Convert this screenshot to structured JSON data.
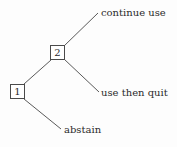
{
  "diagram": {
    "type": "game-tree",
    "background_color": "#fdfdfd",
    "line_color": "#5a5a5a",
    "text_color": "#2b2b2b",
    "node_border_color": "#4a4a4a",
    "node_fill_color": "#ffffff",
    "nodes": [
      {
        "id": "node-1",
        "label": "1",
        "x": 10,
        "y": 84,
        "w": 15,
        "h": 15
      },
      {
        "id": "node-2",
        "label": "2",
        "x": 50,
        "y": 45,
        "w": 15,
        "h": 15
      }
    ],
    "edges": [
      {
        "id": "edge-node1-node2",
        "x1": 24,
        "y1": 84,
        "x2": 51,
        "y2": 60
      },
      {
        "id": "edge-node1-abstain",
        "x1": 24,
        "y1": 99,
        "x2": 61,
        "y2": 129
      },
      {
        "id": "edge-node2-continue-use",
        "x1": 64,
        "y1": 46,
        "x2": 98,
        "y2": 13
      },
      {
        "id": "edge-node2-use-then-quit",
        "x1": 64,
        "y1": 59,
        "x2": 99,
        "y2": 92
      }
    ],
    "labels": [
      {
        "id": "label-continue-use",
        "text": "continue use",
        "x": 101,
        "y": 8
      },
      {
        "id": "label-use-then-quit",
        "text": "use then quit",
        "x": 101,
        "y": 88
      },
      {
        "id": "label-abstain",
        "text": "abstain",
        "x": 64,
        "y": 125
      }
    ]
  }
}
